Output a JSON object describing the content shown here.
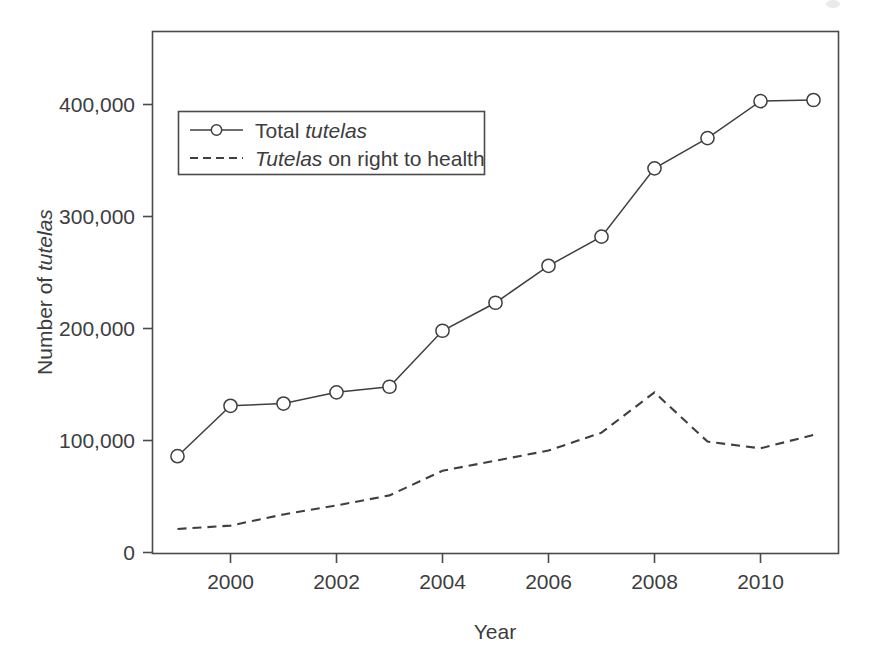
{
  "chart_data": {
    "type": "line",
    "title": "",
    "xlabel": "Year",
    "ylabel": "Number of tutelas",
    "ylabel_parts": {
      "prefix": "Number of ",
      "italic": "tutelas"
    },
    "xlim": [
      1999,
      2011
    ],
    "ylim": [
      0,
      450000
    ],
    "grid": false,
    "legend_position": "top-left",
    "x": [
      1999,
      2000,
      2001,
      2002,
      2003,
      2004,
      2005,
      2006,
      2007,
      2008,
      2009,
      2010,
      2011
    ],
    "xticks": [
      2000,
      2002,
      2004,
      2006,
      2008,
      2010
    ],
    "xtick_labels": [
      "2000",
      "2002",
      "2004",
      "2006",
      "2008",
      "2010"
    ],
    "yticks": [
      0,
      100000,
      200000,
      300000,
      400000
    ],
    "ytick_labels": [
      "0",
      "100,000",
      "200,000",
      "300,000",
      "400,000"
    ],
    "series": [
      {
        "name": "Total tutelas",
        "legend_prefix": "Total ",
        "legend_italic": "tutelas",
        "legend_suffix": "",
        "style": "solid-with-circle-markers",
        "markers": true,
        "values": [
          86000,
          131000,
          133000,
          143000,
          148000,
          198000,
          223000,
          256000,
          282000,
          343000,
          370000,
          403000,
          404000
        ]
      },
      {
        "name": "Tutelas on right to health",
        "legend_prefix": "",
        "legend_italic": "Tutelas",
        "legend_suffix": " on right to health",
        "style": "dashed",
        "markers": false,
        "values": [
          21000,
          24000,
          34000,
          42000,
          51000,
          73000,
          82000,
          91000,
          107000,
          143000,
          99000,
          93000,
          105000
        ]
      }
    ]
  },
  "axes": {
    "x_title": "Year",
    "y_title_prefix": "Number of ",
    "y_title_italic": "tutelas"
  },
  "legend": {
    "entries": [
      {
        "prefix": "Total ",
        "italic": "tutelas",
        "suffix": ""
      },
      {
        "prefix": "",
        "italic": "Tutelas",
        "suffix": " on right to health"
      }
    ]
  }
}
